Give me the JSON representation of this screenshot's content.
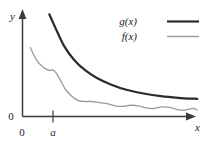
{
  "figure": {
    "background": "#ffffff",
    "axes": {
      "x_axis_label": "x",
      "y_axis_label": "y",
      "y_zero_label": "0",
      "x_zero_label": "0",
      "x_tick_label": "a",
      "axis_color": "#3a3a3a"
    },
    "legend": {
      "position": "top-right",
      "entries": [
        {
          "label": "g(x)",
          "color": "#2b2b2b",
          "width": 2.2
        },
        {
          "label": "f(x)",
          "color": "#9a9a9a",
          "width": 1.3
        }
      ]
    }
  },
  "chart_data": {
    "type": "line",
    "title": "",
    "xlabel": "x",
    "ylabel": "y",
    "xlim": [
      0,
      10
    ],
    "ylim": [
      0,
      10
    ],
    "grid": false,
    "legend_position": "top-right",
    "annotations": [
      {
        "text": "a",
        "axis": "x",
        "value": 1.9
      },
      {
        "text": "0",
        "axis": "y",
        "value": 0
      },
      {
        "text": "0",
        "axis": "origin",
        "value": 0
      }
    ],
    "series": [
      {
        "name": "g(x)",
        "color": "#2b2b2b",
        "linewidth": 2.2,
        "description": "smooth monotone decreasing convex curve, upper bound",
        "x": [
          1.55,
          1.9,
          2.4,
          3.0,
          3.6,
          4.3,
          5.1,
          6.0,
          7.0,
          8.0,
          9.0,
          10.1
        ],
        "y": [
          9.55,
          8.3,
          6.6,
          5.25,
          4.35,
          3.6,
          3.0,
          2.5,
          2.15,
          1.9,
          1.75,
          1.65
        ]
      },
      {
        "name": "f(x)",
        "color": "#9a9a9a",
        "linewidth": 1.3,
        "description": "wavy decreasing curve staying below g(x), with small oscillations",
        "x": [
          0.45,
          0.8,
          1.2,
          1.55,
          1.75,
          1.95,
          2.2,
          2.5,
          2.85,
          3.2,
          3.6,
          4.0,
          4.45,
          4.9,
          5.35,
          5.8,
          6.25,
          6.7,
          7.15,
          7.6,
          8.05,
          8.5,
          8.95,
          9.4,
          9.85,
          10.1
        ],
        "y": [
          6.45,
          5.3,
          4.6,
          4.3,
          4.35,
          4.05,
          3.35,
          2.5,
          1.9,
          1.5,
          1.4,
          1.4,
          1.3,
          1.2,
          1.0,
          0.95,
          1.05,
          1.0,
          0.8,
          0.75,
          0.9,
          0.85,
          0.65,
          0.6,
          0.75,
          0.6
        ]
      }
    ]
  }
}
